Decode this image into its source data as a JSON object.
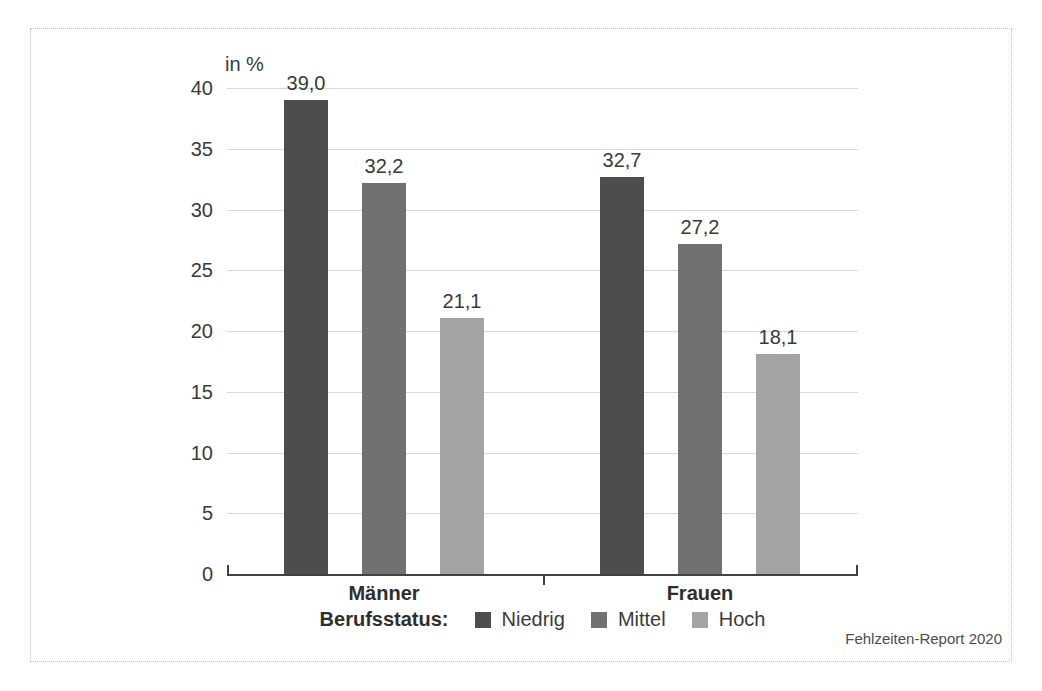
{
  "page": {
    "source_note": "Fehlzeiten-Report 2020",
    "background_color": "#ffffff",
    "frame_border_color": "#c2c2c2"
  },
  "chart_data": {
    "type": "bar",
    "title": "",
    "unit_label": "in %",
    "categories": [
      "Männer",
      "Frauen"
    ],
    "series": [
      {
        "name": "Niedrig",
        "color": "#4d4d4d",
        "values": [
          39.0,
          32.7
        ],
        "labels": [
          "39,0",
          "32,7"
        ]
      },
      {
        "name": "Mittel",
        "color": "#717171",
        "values": [
          32.2,
          27.2
        ],
        "labels": [
          "32,2",
          "27,2"
        ]
      },
      {
        "name": "Hoch",
        "color": "#a3a3a3",
        "values": [
          21.1,
          18.1
        ],
        "labels": [
          "21,1",
          "18,1"
        ]
      }
    ],
    "ylim": [
      0,
      40
    ],
    "yticks": [
      0,
      5,
      10,
      15,
      20,
      25,
      30,
      35,
      40
    ],
    "grid": true,
    "gridline_color": "#d9d9d9",
    "axis_color": "#414141",
    "legend_title": "Berufsstatus:",
    "legend_position": "bottom"
  }
}
